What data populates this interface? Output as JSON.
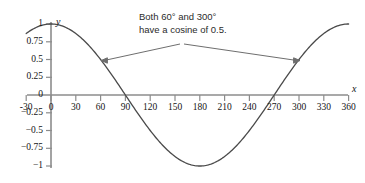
{
  "chart_data": {
    "type": "line",
    "title": "",
    "xlabel": "x",
    "ylabel": "y",
    "xlim": [
      -30,
      360
    ],
    "ylim": [
      -1,
      1
    ],
    "grid": false,
    "legend": "none",
    "series": [
      {
        "name": "cosine",
        "expression": "y = cos(x)",
        "x": [
          -30,
          -20,
          -10,
          0,
          10,
          20,
          30,
          40,
          50,
          60,
          70,
          80,
          90,
          100,
          110,
          120,
          130,
          140,
          150,
          160,
          170,
          180,
          190,
          200,
          210,
          220,
          230,
          240,
          250,
          260,
          270,
          280,
          290,
          300,
          310,
          320,
          330,
          340,
          350,
          360
        ],
        "values": [
          0.866,
          0.94,
          0.985,
          1.0,
          0.985,
          0.94,
          0.866,
          0.766,
          0.643,
          0.5,
          0.342,
          0.174,
          0.0,
          -0.174,
          -0.342,
          -0.5,
          -0.643,
          -0.766,
          -0.866,
          -0.94,
          -0.985,
          -1.0,
          -0.985,
          -0.94,
          -0.866,
          -0.766,
          -0.643,
          -0.5,
          -0.342,
          -0.174,
          0.0,
          0.174,
          0.342,
          0.5,
          0.643,
          0.766,
          0.866,
          0.94,
          0.985,
          1.0
        ]
      }
    ],
    "xticks": [
      "-30",
      "0",
      "30",
      "60",
      "90",
      "120",
      "150",
      "180",
      "210",
      "240",
      "270",
      "300",
      "330",
      "360"
    ],
    "xtick_values": [
      -30,
      0,
      30,
      60,
      90,
      120,
      150,
      180,
      210,
      240,
      270,
      300,
      330,
      360
    ],
    "yticks": [
      "1",
      "0.75",
      "0.5",
      "0.25",
      "0",
      "−0.25",
      "−0.5",
      "−0.75",
      "−1"
    ],
    "ytick_values": [
      1,
      0.75,
      0.5,
      0.25,
      0,
      -0.25,
      -0.5,
      -0.75,
      -1
    ],
    "annotations": [
      {
        "line1": "Both 60° and 300°",
        "line2": "have a cosine of 0.5.",
        "points_to": [
          {
            "x": 60,
            "y": 0.5
          },
          {
            "x": 300,
            "y": 0.5
          }
        ]
      }
    ],
    "colors": {
      "curve": "#4a4a4a",
      "axis": "#8c8c8c",
      "text": "#141414",
      "annotation_text": "#2b2b2b",
      "leader": "#6e6e6e",
      "background": "#ffffff"
    }
  }
}
